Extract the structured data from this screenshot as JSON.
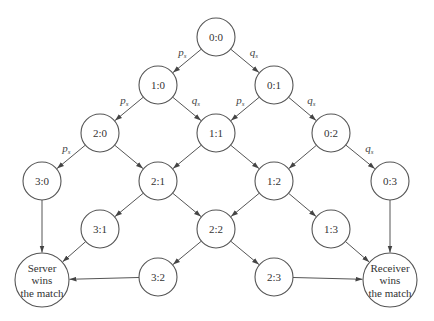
{
  "diagram": {
    "type": "state-transition",
    "nodes": [
      {
        "id": "0:0",
        "label": "0:0",
        "x": 216,
        "y": 37,
        "r": 19
      },
      {
        "id": "1:0",
        "label": "1:0",
        "x": 158,
        "y": 85,
        "r": 19
      },
      {
        "id": "0:1",
        "label": "0:1",
        "x": 274,
        "y": 85,
        "r": 19
      },
      {
        "id": "2:0",
        "label": "2:0",
        "x": 100,
        "y": 133,
        "r": 19
      },
      {
        "id": "1:1",
        "label": "1:1",
        "x": 216,
        "y": 133,
        "r": 19
      },
      {
        "id": "0:2",
        "label": "0:2",
        "x": 331,
        "y": 133,
        "r": 19
      },
      {
        "id": "3:0",
        "label": "3:0",
        "x": 42,
        "y": 181,
        "r": 19
      },
      {
        "id": "2:1",
        "label": "2:1",
        "x": 158,
        "y": 181,
        "r": 19
      },
      {
        "id": "1:2",
        "label": "1:2",
        "x": 274,
        "y": 181,
        "r": 19
      },
      {
        "id": "0:3",
        "label": "0:3",
        "x": 390,
        "y": 181,
        "r": 19
      },
      {
        "id": "3:1",
        "label": "3:1",
        "x": 100,
        "y": 229,
        "r": 19
      },
      {
        "id": "2:2",
        "label": "2:2",
        "x": 216,
        "y": 229,
        "r": 19
      },
      {
        "id": "1:3",
        "label": "1:3",
        "x": 331,
        "y": 229,
        "r": 19
      },
      {
        "id": "3:2",
        "label": "3:2",
        "x": 158,
        "y": 277,
        "r": 19
      },
      {
        "id": "2:3",
        "label": "2:3",
        "x": 274,
        "y": 277,
        "r": 19
      },
      {
        "id": "server-wins",
        "lines": [
          "Server",
          "wins",
          "the match"
        ],
        "x": 42,
        "y": 280,
        "r": 27
      },
      {
        "id": "receiver-wins",
        "lines": [
          "Receiver",
          "wins",
          "the match"
        ],
        "x": 390,
        "y": 280,
        "r": 27
      }
    ],
    "edges": [
      {
        "from": "0:0",
        "to": "1:0",
        "label": "p",
        "sub": "s"
      },
      {
        "from": "0:0",
        "to": "0:1",
        "label": "q",
        "sub": "s"
      },
      {
        "from": "1:0",
        "to": "2:0",
        "label": "p",
        "sub": "s"
      },
      {
        "from": "1:0",
        "to": "1:1",
        "label": "q",
        "sub": "s"
      },
      {
        "from": "0:1",
        "to": "1:1",
        "label": "p",
        "sub": "s"
      },
      {
        "from": "0:1",
        "to": "0:2",
        "label": "q",
        "sub": "s"
      },
      {
        "from": "2:0",
        "to": "3:0",
        "label": "p",
        "sub": "s"
      },
      {
        "from": "2:0",
        "to": "2:1"
      },
      {
        "from": "1:1",
        "to": "2:1"
      },
      {
        "from": "1:1",
        "to": "1:2"
      },
      {
        "from": "0:2",
        "to": "1:2"
      },
      {
        "from": "0:2",
        "to": "0:3",
        "label": "q",
        "sub": "s"
      },
      {
        "from": "3:0",
        "to": "server-wins"
      },
      {
        "from": "2:1",
        "to": "3:1"
      },
      {
        "from": "2:1",
        "to": "2:2"
      },
      {
        "from": "1:2",
        "to": "2:2"
      },
      {
        "from": "1:2",
        "to": "1:3"
      },
      {
        "from": "0:3",
        "to": "receiver-wins"
      },
      {
        "from": "3:1",
        "to": "server-wins"
      },
      {
        "from": "2:2",
        "to": "3:2"
      },
      {
        "from": "2:2",
        "to": "2:3"
      },
      {
        "from": "1:3",
        "to": "receiver-wins"
      },
      {
        "from": "3:2",
        "to": "server-wins"
      },
      {
        "from": "2:3",
        "to": "receiver-wins"
      }
    ],
    "colors": {
      "stroke": "#555555",
      "text": "#333333",
      "background": "#ffffff"
    }
  }
}
